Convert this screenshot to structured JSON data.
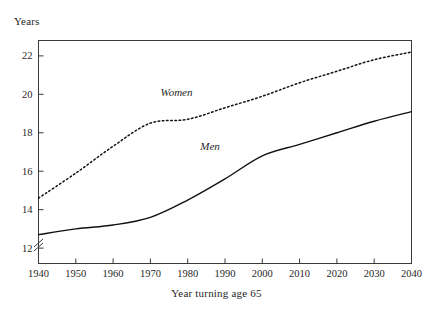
{
  "figure": {
    "y_axis_title": "Years",
    "x_axis_title": "Year turning age 65",
    "axis_break_symbol": "axis-break",
    "ink_color": "#111111",
    "frame_color": "#3a3a3a"
  },
  "chart_data": {
    "type": "line",
    "title": "",
    "subtitle": "",
    "xlabel": "Year turning age 65",
    "ylabel": "Years",
    "xlim": [
      1940,
      2040
    ],
    "ylim": [
      11.2,
      22.8
    ],
    "xticks": [
      1940,
      1950,
      1960,
      1970,
      1980,
      1990,
      2000,
      2010,
      2020,
      2030,
      2040
    ],
    "xtick_labels": [
      "1940",
      "1950",
      "1960",
      "1970",
      "1980",
      "1990",
      "2000",
      "2010",
      "2020",
      "2030",
      "2040"
    ],
    "yticks": [
      12,
      14,
      16,
      18,
      20,
      22
    ],
    "ytick_labels": [
      "12",
      "14",
      "16",
      "18",
      "20",
      "22"
    ],
    "y_axis_broken": true,
    "grid": false,
    "legend": "inline-annotations",
    "x": [
      1940,
      1950,
      1960,
      1970,
      1980,
      1990,
      2000,
      2010,
      2020,
      2030,
      2040
    ],
    "series": [
      {
        "name": "Women",
        "style": "dotted",
        "label_x": 1977,
        "label_y": 19.9,
        "values": [
          14.6,
          15.9,
          17.3,
          18.5,
          18.7,
          19.3,
          19.9,
          20.6,
          21.2,
          21.8,
          22.2
        ]
      },
      {
        "name": "Men",
        "style": "solid",
        "label_x": 1986,
        "label_y": 17.1,
        "values": [
          12.7,
          13.0,
          13.2,
          13.6,
          14.5,
          15.6,
          16.8,
          17.4,
          18.0,
          18.6,
          19.1
        ]
      }
    ],
    "annotations": [
      {
        "text": "Women",
        "x": 1977,
        "y": 19.9,
        "italic": true
      },
      {
        "text": "Men",
        "x": 1986,
        "y": 17.1,
        "italic": true
      }
    ]
  }
}
